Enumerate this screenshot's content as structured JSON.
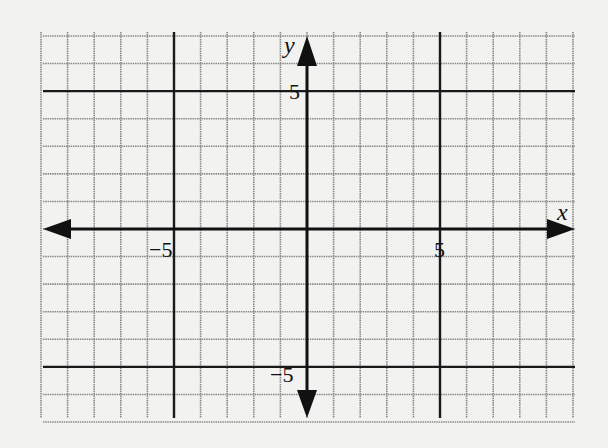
{
  "diagram": {
    "type": "coordinate-plane",
    "x_axis_label": "x",
    "y_axis_label": "y",
    "x_range": [
      -10,
      10
    ],
    "y_range": [
      -7,
      7
    ],
    "grid_step": 1,
    "emphasized_lines": {
      "x": [
        -5,
        5
      ],
      "y": [
        -5,
        5
      ]
    },
    "tick_labels": {
      "x_neg": "−5",
      "x_pos": "5",
      "y_pos": "5",
      "y_neg": "−5"
    },
    "colors": {
      "background": "#f2f2f0",
      "grid": "#8a8a8a",
      "bold_line": "#1a1a1a",
      "axis": "#111111"
    }
  }
}
